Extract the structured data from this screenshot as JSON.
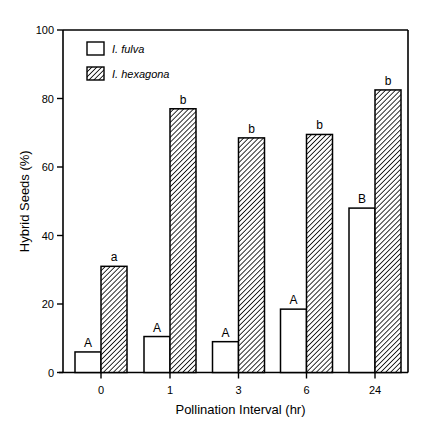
{
  "chart_data": {
    "type": "bar",
    "title": "",
    "xlabel": "Pollination Interval (hr)",
    "ylabel": "Hybrid Seeds (%)",
    "ylim": [
      0,
      100
    ],
    "yticks": [
      0,
      20,
      40,
      60,
      80,
      100
    ],
    "grid": false,
    "legend_position": "upper-left",
    "categories": [
      "0",
      "1",
      "3",
      "6",
      "24"
    ],
    "series": [
      {
        "name": "I. fulva",
        "fill": "white",
        "values": [
          6,
          10.5,
          9,
          18.5,
          48
        ],
        "letters": [
          "A",
          "A",
          "A",
          "A",
          "B"
        ]
      },
      {
        "name": "I. hexagona",
        "fill": "hatched",
        "values": [
          31,
          77,
          68.5,
          69.5,
          82.5
        ],
        "letters": [
          "a",
          "b",
          "b",
          "b",
          "b"
        ]
      }
    ]
  }
}
